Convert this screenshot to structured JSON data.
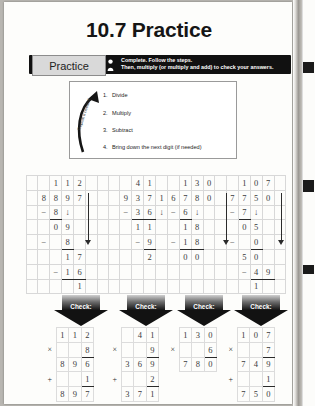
{
  "page": {
    "title": "10.7 Practice",
    "banner": {
      "tab_label": "Practice",
      "person_icon": "person-icon",
      "instruction_line1": "Complete. Follow the steps.",
      "instruction_line2": "Then, multiply (or multiply and add) to check your answers."
    },
    "steps_box": {
      "rotated_label": "Repeat if needed",
      "arrow_icon": "curved-up-arrow-icon",
      "steps": [
        {
          "num": "1.",
          "text": "Divide"
        },
        {
          "num": "2.",
          "text": "Multiply"
        },
        {
          "num": "3.",
          "text": "Subtract"
        },
        {
          "num": "4.",
          "text": "Bring down the next digit (if needed)"
        }
      ]
    },
    "check_label": "Check:",
    "problems": [
      {
        "divisor": "8",
        "dividend": "897",
        "quotient": "112",
        "remainder": "1",
        "work": {
          "partial1": "8",
          "sub1_result": "09",
          "partial2": "8",
          "sub2_result": "17",
          "partial3": "16",
          "final_remainder": "1"
        },
        "check": {
          "factor1": "112",
          "operator_multiply": "×",
          "factor2": "8",
          "product": "896",
          "operator_add": "+",
          "addend": "1",
          "sum": "897"
        }
      },
      {
        "divisor": "9",
        "dividend": "371",
        "quotient": "41",
        "remainder": "2",
        "work": {
          "partial1": "36",
          "sub1_result": "11",
          "partial2": "9",
          "final_remainder": "2"
        },
        "check": {
          "factor1": "41",
          "operator_multiply": "×",
          "factor2": "9",
          "product": "369",
          "operator_add": "+",
          "addend": "2",
          "sum": "371"
        }
      },
      {
        "divisor": "6",
        "dividend": "780",
        "quotient": "130",
        "remainder": "0",
        "work": {
          "partial1": "6",
          "sub1_result": "18",
          "partial2": "18",
          "final_remainder": "00"
        },
        "check": {
          "factor1": "130",
          "operator_multiply": "×",
          "factor2": "6",
          "product": "780",
          "operator_add": "",
          "addend": "",
          "sum": ""
        }
      },
      {
        "divisor": "7",
        "dividend": "750",
        "quotient": "107",
        "remainder": "1",
        "work": {
          "partial1": "7",
          "sub1_result": "05",
          "partial2": "0",
          "sub2_result": "50",
          "partial3": "49",
          "final_remainder": "1"
        },
        "check": {
          "factor1": "107",
          "operator_multiply": "×",
          "factor2": "7",
          "product": "749",
          "operator_add": "+",
          "addend": "1",
          "sum": "750"
        }
      }
    ]
  }
}
